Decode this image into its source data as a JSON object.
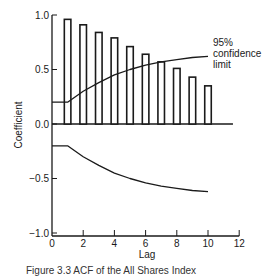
{
  "chart_data": {
    "type": "bar",
    "title": "",
    "xlabel": "Lag",
    "ylabel": "Coefficient",
    "xlim": [
      0,
      12
    ],
    "ylim": [
      -1.0,
      1.0
    ],
    "xticks": [
      0,
      2,
      4,
      6,
      8,
      10,
      12
    ],
    "xtick_labels": [
      "0",
      "2",
      "4",
      "6",
      "8",
      "10",
      "12"
    ],
    "yticks": [
      1.0,
      0.5,
      0.0,
      -0.5,
      -1.0
    ],
    "ytick_labels": [
      "1.0",
      "0.5",
      "0.0",
      "−0.5",
      "−1.0"
    ],
    "grid": false,
    "categories": [
      1,
      2,
      3,
      4,
      5,
      6,
      7,
      8,
      9,
      10
    ],
    "series": [
      {
        "name": "ACF",
        "values": [
          0.96,
          0.91,
          0.84,
          0.79,
          0.71,
          0.64,
          0.57,
          0.51,
          0.43,
          0.35
        ]
      }
    ],
    "confidence_limits": {
      "label": "95% confidence limit",
      "upper": {
        "x": [
          0,
          1,
          2,
          3,
          4,
          5,
          6,
          7,
          8,
          9,
          10
        ],
        "y": [
          0.2,
          0.2,
          0.3,
          0.38,
          0.45,
          0.5,
          0.54,
          0.57,
          0.59,
          0.61,
          0.62
        ]
      },
      "lower": {
        "x": [
          0,
          1,
          2,
          3,
          4,
          5,
          6,
          7,
          8,
          9,
          10
        ],
        "y": [
          -0.2,
          -0.2,
          -0.3,
          -0.38,
          -0.45,
          -0.5,
          -0.54,
          -0.57,
          -0.59,
          -0.61,
          -0.62
        ]
      }
    },
    "annotations": [
      "95%",
      "confidence",
      "limit"
    ],
    "caption": "Figure 3.3   ACF of the All Shares Index"
  }
}
